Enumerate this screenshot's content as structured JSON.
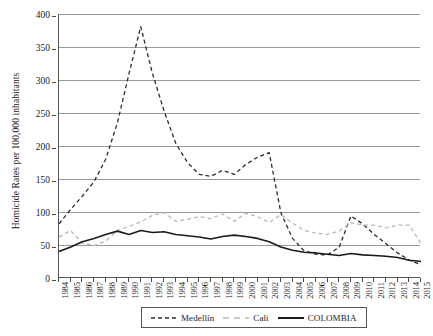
{
  "chart_data": {
    "type": "line",
    "title": "",
    "xlabel": "",
    "ylabel": "Homicide Rates per 100,000 inhabitants",
    "ylim": [
      0,
      400
    ],
    "yticks": [
      0,
      50,
      100,
      150,
      200,
      250,
      300,
      350,
      400
    ],
    "grid": true,
    "legend_position": "bottom",
    "categories": [
      "1984",
      "1985",
      "1986",
      "1987",
      "1988",
      "1989",
      "1990",
      "1991",
      "1992",
      "1993",
      "1994",
      "1995",
      "1996",
      "1997",
      "1998",
      "1999",
      "2000",
      "2001",
      "2002",
      "2003",
      "2004",
      "2005",
      "2006",
      "2007",
      "2008",
      "2009",
      "2010",
      "2011",
      "2012",
      "2013",
      "2014",
      "2015"
    ],
    "series": [
      {
        "name": "Medellín",
        "color": "#2b2b2b",
        "style": "dashed",
        "values": [
          82,
          104,
          124,
          146,
          180,
          235,
          310,
          381,
          310,
          253,
          204,
          175,
          157,
          154,
          163,
          157,
          172,
          183,
          190,
          99,
          60,
          41,
          36,
          35,
          47,
          94,
          82,
          66,
          52,
          38,
          27,
          20
        ]
      },
      {
        "name": "Cali",
        "color": "#b9b9b9",
        "style": "dashed",
        "values": [
          62,
          72,
          53,
          49,
          56,
          72,
          78,
          85,
          95,
          99,
          86,
          89,
          93,
          90,
          97,
          86,
          98,
          93,
          84,
          96,
          83,
          72,
          68,
          66,
          71,
          84,
          80,
          80,
          76,
          80,
          80,
          52
        ]
      },
      {
        "name": "COLOMBIA",
        "color": "#1a1a1a",
        "style": "solid",
        "values": [
          40,
          47,
          55,
          60,
          66,
          71,
          66,
          72,
          69,
          70,
          66,
          64,
          62,
          59,
          63,
          65,
          63,
          60,
          55,
          47,
          42,
          39,
          38,
          36,
          34,
          37,
          35,
          34,
          33,
          31,
          27,
          25
        ]
      }
    ]
  },
  "axis": {
    "y_title": "Homicide Rates per 100,000 inhabitants"
  },
  "legend": {
    "items": [
      {
        "label": "Medellín"
      },
      {
        "label": "Cali"
      },
      {
        "label": "COLOMBIA"
      }
    ]
  }
}
